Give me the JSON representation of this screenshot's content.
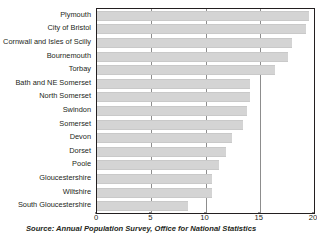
{
  "chart_data": {
    "type": "bar",
    "orientation": "horizontal",
    "title": "",
    "xlabel": "",
    "ylabel": "",
    "xlim": [
      0,
      20
    ],
    "xticks": [
      0,
      5,
      10,
      15,
      20
    ],
    "grid": true,
    "legend": null,
    "bar_color": "#d4d4d4",
    "categories": [
      "Plymouth",
      "City of Bristol",
      "Cornwall and Isles of Scilly",
      "Bournemouth",
      "Torbay",
      "Bath and NE Somerset",
      "North Somerset",
      "Swindon",
      "Somerset",
      "Devon",
      "Dorset",
      "Poole",
      "Gloucestershire",
      "Wiltshire",
      "South Gloucestershire"
    ],
    "values": [
      19.5,
      19.3,
      18.0,
      17.6,
      16.4,
      14.1,
      14.1,
      13.8,
      13.5,
      12.4,
      11.9,
      11.2,
      10.6,
      10.6,
      8.4
    ]
  },
  "source": {
    "text": "Source: Annual Population Survey, Office for National Statistics"
  }
}
